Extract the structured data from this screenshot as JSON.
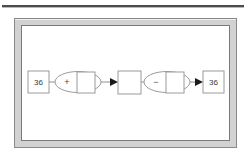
{
  "document": {
    "top_rule": "horizontal-rule"
  },
  "frame": {
    "style": "beveled-gray-frame",
    "border_color": "#8a8a8a",
    "band_color": "#d2d2d2",
    "canvas_color": "#ffffff"
  },
  "diagram": {
    "type": "flow-chart",
    "orientation": "left-to-right",
    "nodes": [
      {
        "id": "input-value",
        "shape": "rectangle",
        "label": "36",
        "role": "input-terminal"
      },
      {
        "id": "add-operator",
        "shape": "ellipse",
        "label": "+",
        "operand_label": "",
        "role": "addition-operator"
      },
      {
        "id": "intermediate-value",
        "shape": "rectangle",
        "label": "",
        "role": "intermediate-result"
      },
      {
        "id": "subtract-operator",
        "shape": "ellipse",
        "label": "−",
        "operand_label": "",
        "role": "subtraction-operator"
      },
      {
        "id": "output-value",
        "shape": "rectangle",
        "label": "36",
        "role": "output-terminal"
      }
    ],
    "edges": [
      {
        "from": "input-value",
        "to": "add-operator",
        "arrow": false
      },
      {
        "from": "add-operator",
        "to": "intermediate-value",
        "arrow": true
      },
      {
        "from": "intermediate-value",
        "to": "subtract-operator",
        "arrow": false
      },
      {
        "from": "subtract-operator",
        "to": "output-value",
        "arrow": true
      }
    ],
    "colors": {
      "shape_stroke": "#9a9a9a",
      "connector": "#8f8f8f",
      "arrow": "#1a1a1a",
      "text": "#3a3a3a"
    }
  }
}
